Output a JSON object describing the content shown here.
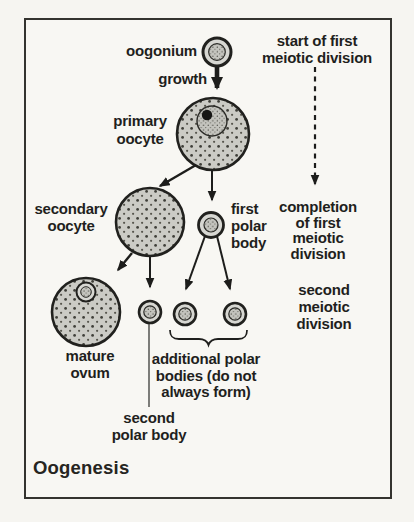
{
  "figure": {
    "title": "Oogenesis",
    "stages": {
      "oogonium": "oogonium",
      "growth": "growth",
      "primary_oocyte": "primary\noocyte",
      "secondary_oocyte": "secondary\noocyte",
      "first_polar_body": "first\npolar\nbody",
      "mature_ovum": "mature\novum",
      "second_polar_body": "second\npolar body",
      "additional_polar_bodies": "additional polar\nbodies (do not\nalways form)"
    },
    "annotations": {
      "start_first_meiotic": "start of first\nmeiotic division",
      "completion_first_meiotic": "completion\nof first\nmeiotic\ndivision",
      "second_meiotic": "second\nmeiotic\ndivision"
    },
    "colors": {
      "ink": "#1f1f1d",
      "paper": "#f6f5f1",
      "cell_fill": "#cbcbc5",
      "cell_ring": "#d7d7d2",
      "stipple_dot": "#45453f"
    }
  }
}
